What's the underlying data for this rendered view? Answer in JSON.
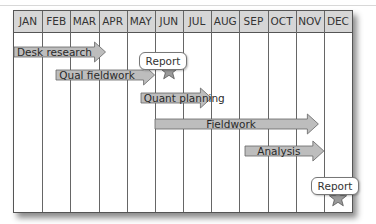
{
  "chart_data": {
    "type": "gantt",
    "title": "",
    "months": [
      "JAN",
      "FEB",
      "MAR",
      "APR",
      "MAY",
      "JUN",
      "JUL",
      "AUG",
      "SEP",
      "OCT",
      "NOV",
      "DEC"
    ],
    "tasks": [
      {
        "name": "Desk research",
        "start": 0.0,
        "end": 3.25
      },
      {
        "name": "Qual fieldwork",
        "start": 1.5,
        "end": 5.0
      },
      {
        "name": "Quant planning",
        "start": 4.5,
        "end": 7.0
      },
      {
        "name": "Fieldwork",
        "start": 5.0,
        "end": 10.8
      },
      {
        "name": "Analysis",
        "start": 8.2,
        "end": 11.0
      }
    ],
    "milestones": [
      {
        "label": "Report",
        "position": 5.5,
        "marker": "star"
      },
      {
        "label": "Report",
        "position": 11.5,
        "marker": "star"
      }
    ],
    "colors": {
      "header": "#d6d6d6",
      "bar": "#bdbdbd",
      "star": "#9a9a9a",
      "grid": "#666666"
    }
  }
}
